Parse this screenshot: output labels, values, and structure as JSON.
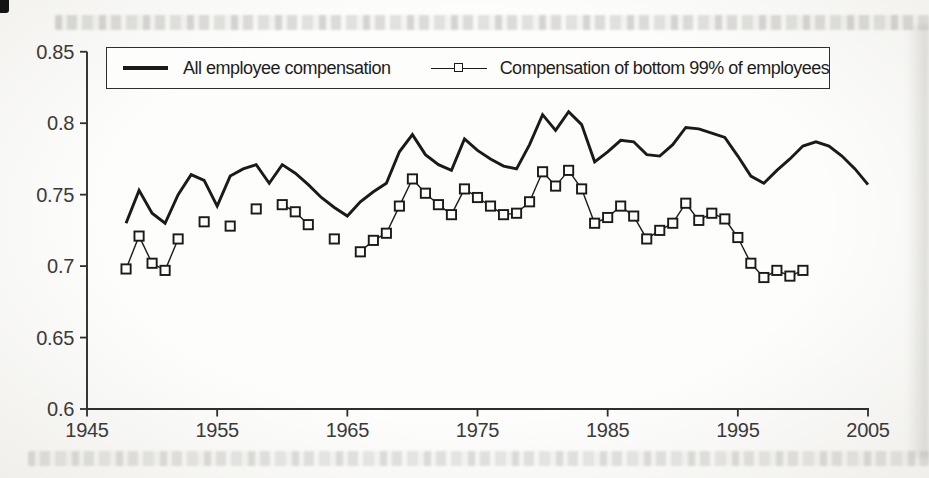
{
  "colors": {
    "ink": "#1a1a1a",
    "axis": "#2e2e2e",
    "tick_label": "#3a3a3a",
    "paper": "#fdfdfb",
    "scan_gray": "#949288"
  },
  "legend": {
    "series1_label": "All employee compensation",
    "series2_label": "Compensation of bottom 99% of employees"
  },
  "chart_data": {
    "type": "line",
    "title": "",
    "xlabel": "",
    "ylabel": "",
    "grid": false,
    "legend_position": "top inside framed box",
    "x_axis": {
      "min": 1945,
      "max": 2005,
      "ticks": [
        1945,
        1955,
        1965,
        1975,
        1985,
        1995,
        2005
      ],
      "tick_labels": [
        "1945",
        "1955",
        "1965",
        "1975",
        "1985",
        "1995",
        "2005"
      ]
    },
    "y_axis": {
      "min": 0.6,
      "max": 0.85,
      "ticks": [
        0.85,
        0.8,
        0.75,
        0.7,
        0.65,
        0.6
      ],
      "tick_labels": [
        "0.85",
        "0.8",
        "0.75",
        "0.7",
        "0.65",
        "0.6"
      ]
    },
    "series": [
      {
        "name": "All employee compensation",
        "style": "thick-solid-line",
        "marker": "none",
        "points": [
          [
            1948,
            0.73
          ],
          [
            1949,
            0.753
          ],
          [
            1950,
            0.737
          ],
          [
            1951,
            0.73
          ],
          [
            1952,
            0.75
          ],
          [
            1953,
            0.764
          ],
          [
            1954,
            0.76
          ],
          [
            1955,
            0.742
          ],
          [
            1956,
            0.763
          ],
          [
            1957,
            0.768
          ],
          [
            1958,
            0.771
          ],
          [
            1959,
            0.758
          ],
          [
            1960,
            0.771
          ],
          [
            1961,
            0.765
          ],
          [
            1962,
            0.757
          ],
          [
            1963,
            0.748
          ],
          [
            1964,
            0.741
          ],
          [
            1965,
            0.735
          ],
          [
            1966,
            0.745
          ],
          [
            1967,
            0.752
          ],
          [
            1968,
            0.758
          ],
          [
            1969,
            0.78
          ],
          [
            1970,
            0.792
          ],
          [
            1971,
            0.778
          ],
          [
            1972,
            0.771
          ],
          [
            1973,
            0.767
          ],
          [
            1974,
            0.789
          ],
          [
            1975,
            0.781
          ],
          [
            1976,
            0.775
          ],
          [
            1977,
            0.77
          ],
          [
            1978,
            0.768
          ],
          [
            1979,
            0.785
          ],
          [
            1980,
            0.806
          ],
          [
            1981,
            0.795
          ],
          [
            1982,
            0.808
          ],
          [
            1983,
            0.799
          ],
          [
            1984,
            0.773
          ],
          [
            1985,
            0.78
          ],
          [
            1986,
            0.788
          ],
          [
            1987,
            0.787
          ],
          [
            1988,
            0.778
          ],
          [
            1989,
            0.777
          ],
          [
            1990,
            0.785
          ],
          [
            1991,
            0.797
          ],
          [
            1992,
            0.796
          ],
          [
            1993,
            0.793
          ],
          [
            1994,
            0.79
          ],
          [
            1995,
            0.777
          ],
          [
            1996,
            0.763
          ],
          [
            1997,
            0.758
          ],
          [
            1998,
            0.767
          ],
          [
            1999,
            0.775
          ],
          [
            2000,
            0.784
          ],
          [
            2001,
            0.787
          ],
          [
            2002,
            0.784
          ],
          [
            2003,
            0.777
          ],
          [
            2004,
            0.768
          ],
          [
            2005,
            0.757
          ]
        ]
      },
      {
        "name": "Compensation of bottom 99% of employees",
        "style": "thin-line",
        "marker": "open-square",
        "note": "some years missing; connecting line drawn only between consecutive years",
        "points": [
          [
            1948,
            0.698
          ],
          [
            1949,
            0.721
          ],
          [
            1950,
            0.702
          ],
          [
            1951,
            0.697
          ],
          [
            1952,
            0.719
          ],
          [
            1954,
            0.731
          ],
          [
            1956,
            0.728
          ],
          [
            1958,
            0.74
          ],
          [
            1960,
            0.743
          ],
          [
            1961,
            0.738
          ],
          [
            1962,
            0.729
          ],
          [
            1964,
            0.719
          ],
          [
            1966,
            0.71
          ],
          [
            1967,
            0.718
          ],
          [
            1968,
            0.723
          ],
          [
            1969,
            0.742
          ],
          [
            1970,
            0.761
          ],
          [
            1971,
            0.751
          ],
          [
            1972,
            0.743
          ],
          [
            1973,
            0.736
          ],
          [
            1974,
            0.754
          ],
          [
            1975,
            0.748
          ],
          [
            1976,
            0.742
          ],
          [
            1977,
            0.736
          ],
          [
            1978,
            0.737
          ],
          [
            1979,
            0.745
          ],
          [
            1980,
            0.766
          ],
          [
            1981,
            0.756
          ],
          [
            1982,
            0.767
          ],
          [
            1983,
            0.754
          ],
          [
            1984,
            0.73
          ],
          [
            1985,
            0.734
          ],
          [
            1986,
            0.742
          ],
          [
            1987,
            0.735
          ],
          [
            1988,
            0.719
          ],
          [
            1989,
            0.725
          ],
          [
            1990,
            0.73
          ],
          [
            1991,
            0.744
          ],
          [
            1992,
            0.732
          ],
          [
            1993,
            0.737
          ],
          [
            1994,
            0.733
          ],
          [
            1995,
            0.72
          ],
          [
            1996,
            0.702
          ],
          [
            1997,
            0.692
          ],
          [
            1998,
            0.697
          ],
          [
            1999,
            0.693
          ],
          [
            2000,
            0.697
          ]
        ]
      }
    ]
  }
}
